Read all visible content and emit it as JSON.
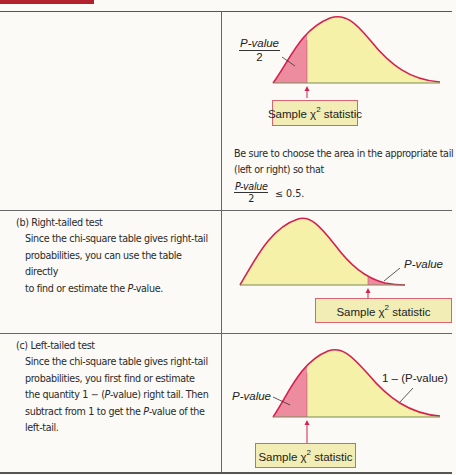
{
  "colors": {
    "accent_bar": "#b3212e",
    "curve_stroke": "#d6204f",
    "tail_fill": "#ec8c9e",
    "body_fill": "#f6f1a8",
    "label_box_fill": "#f1edb4",
    "label_box_border": "#d96370"
  },
  "panel_a": {
    "figure": {
      "tail_label_num": "P-value",
      "tail_label_den": "2",
      "statistic_box": "Sample χ",
      "statistic_sup": "2",
      "statistic_suffix": " statistic"
    },
    "note_line1": "Be sure to choose the area in the appropriate tail",
    "note_line2": "(left or right) so that",
    "condition_num": "P-value",
    "condition_den": "2",
    "condition_rhs": "≤ 0.5."
  },
  "panel_b": {
    "heading": "(b) Right-tailed test",
    "lines": [
      "Since the chi-square table gives right-tail",
      "probabilities, you can use the table directly",
      "to find or estimate the P-value."
    ],
    "figure": {
      "tail_label": "P-value",
      "statistic_box": "Sample χ",
      "statistic_sup": "2",
      "statistic_suffix": " statistic"
    }
  },
  "panel_c": {
    "heading": "(c) Left-tailed test",
    "lines": [
      "Since the chi-square table gives right-tail",
      "probabilities, you first find  or estimate",
      "the quantity 1  −  (P-value) right tail. Then",
      "subtract from 1 to get the P-value of the",
      "left-tail."
    ],
    "figure": {
      "tail_label": "P-value",
      "complement_label": "1 – (P-value)",
      "statistic_box": "Sample χ",
      "statistic_sup": "2",
      "statistic_suffix": " statistic"
    }
  }
}
